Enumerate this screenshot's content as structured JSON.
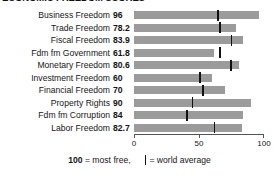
{
  "title": "ECONOMIC FREEDOM SCORES",
  "axis": {
    "ticks": [
      0,
      50,
      100
    ],
    "tick_labels": [
      "0",
      "50",
      "100"
    ],
    "min": 0,
    "max": 100
  },
  "footer": {
    "most_free_value": "100",
    "most_free_text": " = most free,",
    "world_average_text": " = world average"
  },
  "colors": {
    "bar": "#9b9b9b",
    "marker": "#111111",
    "text": "#161616",
    "background": "#ffffff"
  },
  "chart_data": {
    "type": "bar",
    "orientation": "horizontal",
    "title": "ECONOMIC FREEDOM SCORES",
    "xlabel": "",
    "ylabel": "",
    "xlim": [
      0,
      100
    ],
    "grid": false,
    "legend_position": "bottom",
    "categories": [
      "Business Freedom",
      "Trade Freedom",
      "Fiscal Freedom",
      "Fdm fm Government",
      "Monetary Freedom",
      "Investment Freedom",
      "Financial Freedom",
      "Property Rights",
      "Fdm fm Corruption",
      "Labor Freedom"
    ],
    "values": [
      96,
      78.2,
      83.9,
      61.8,
      80.6,
      60,
      70,
      90,
      84,
      82.7
    ],
    "value_labels": [
      "96",
      "78.2",
      "83.9",
      "61.8",
      "80.6",
      "60",
      "70",
      "90",
      "84",
      "82.7"
    ],
    "series": [
      {
        "name": "Country score",
        "values": [
          96,
          78.2,
          83.9,
          61.8,
          80.6,
          60,
          70,
          90,
          84,
          82.7
        ]
      },
      {
        "name": "World average",
        "type": "marker",
        "values": [
          64.6,
          66.0,
          74.9,
          66.0,
          74.5,
          51.0,
          53.0,
          45.0,
          41.0,
          62.0
        ]
      }
    ]
  }
}
